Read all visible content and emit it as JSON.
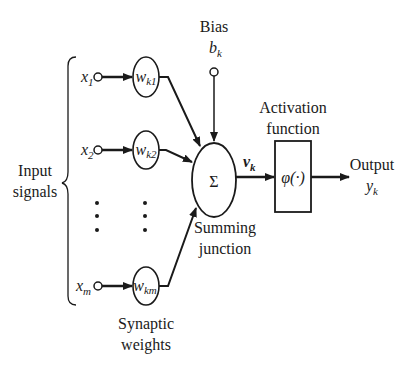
{
  "diagram": {
    "labels": {
      "input_line1": "Input",
      "input_line2": "signals",
      "bias_title": "Bias",
      "bias_symbol": "b",
      "bias_sub": "k",
      "activation_line1": "Activation",
      "activation_line2": "function",
      "output_title": "Output",
      "output_symbol": "y",
      "output_sub": "k",
      "summing_line1": "Summing",
      "summing_line2": "junction",
      "synaptic_line1": "Synaptic",
      "synaptic_line2": "weights",
      "sum_symbol": "Σ",
      "induced_field_symbol": "v",
      "induced_field_sub": "k",
      "activation_symbol": "φ(·)"
    },
    "inputs": [
      {
        "symbol": "x",
        "sub": "1",
        "weight_symbol": "w",
        "weight_sub": "k1"
      },
      {
        "symbol": "x",
        "sub": "2",
        "weight_symbol": "w",
        "weight_sub": "k2"
      },
      {
        "symbol": "x",
        "sub": "m",
        "weight_symbol": "w",
        "weight_sub": "km"
      }
    ],
    "colors": {
      "ink": "#1a1a1a",
      "background": "#ffffff"
    }
  }
}
